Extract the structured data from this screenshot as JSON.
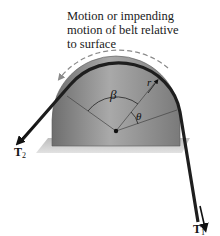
{
  "caption": {
    "lines": [
      "Motion or impending",
      "motion of belt relative",
      "to surface"
    ]
  },
  "labels": {
    "beta": "β",
    "theta": "θ",
    "radius": "r",
    "t1": "T",
    "t1_sub": "1",
    "t2": "T",
    "t2_sub": "2"
  },
  "colors": {
    "drum": "#8f8f8f",
    "belt": "#1e1e1e",
    "plate": "#c8c8c8",
    "dashed_arrow": "#8a8a8a"
  }
}
